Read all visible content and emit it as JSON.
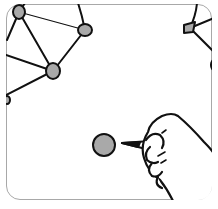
{
  "illustration": {
    "subject": "hand drawing a network diagram with a pen",
    "colors": {
      "stroke": "#111111",
      "node_fill": "#a9a9a9",
      "frame_border": "#a8a8a8",
      "background": "#ffffff"
    },
    "nodes": [
      {
        "id": "n1",
        "cx": 19,
        "cy": 12,
        "rx": 6,
        "ry": 7
      },
      {
        "id": "n2",
        "cx": 85,
        "cy": 30,
        "rx": 7,
        "ry": 6
      },
      {
        "id": "n3",
        "cx": 53,
        "cy": 71,
        "rx": 7,
        "ry": 8
      },
      {
        "id": "n4",
        "cx": 104,
        "cy": 145,
        "rx": 12,
        "ry": 11
      }
    ]
  }
}
